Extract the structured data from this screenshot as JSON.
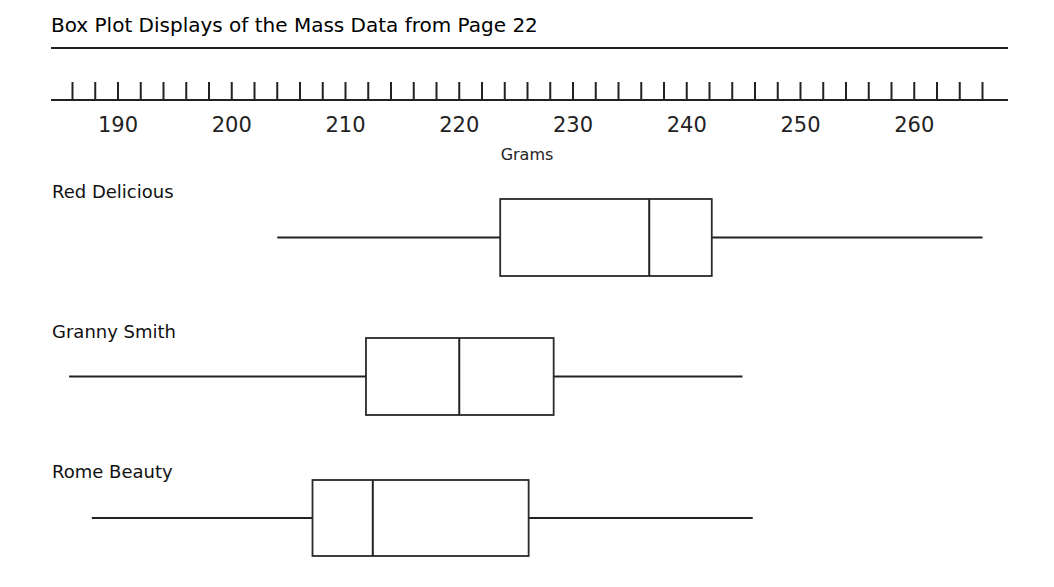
{
  "chart_data": {
    "type": "boxplot",
    "title": "Box Plot Displays of the Mass Data from Page 22",
    "xlabel": "Grams",
    "ylabel": "",
    "xlim": [
      186,
      266
    ],
    "tick_step": 2,
    "tick_labels": [
      190,
      200,
      210,
      220,
      230,
      240,
      250,
      260
    ],
    "grid": false,
    "legend": null,
    "series": [
      {
        "name": "Red Delicious",
        "min": 204,
        "q1": 223.6,
        "median": 236.7,
        "q3": 242.2,
        "max": 266
      },
      {
        "name": "Granny Smith",
        "min": 185.7,
        "q1": 211.8,
        "median": 220,
        "q3": 228.3,
        "max": 244.9
      },
      {
        "name": "Rome Beauty",
        "min": 187.7,
        "q1": 207.1,
        "median": 212.4,
        "q3": 226.1,
        "max": 245.8
      }
    ]
  },
  "layout": {
    "x0_value": 190,
    "x0_px": 118,
    "px_per_unit": 11.375,
    "axis_y": 100,
    "tick_height": 18,
    "axis_left": 51,
    "axis_right": 1008,
    "title_rule_y": 48,
    "rows": [
      {
        "label_y": 198,
        "box_top": 199,
        "box_bottom": 276
      },
      {
        "label_y": 338,
        "box_top": 338,
        "box_bottom": 415
      },
      {
        "label_y": 478,
        "box_top": 480,
        "box_bottom": 556
      }
    ]
  },
  "colors": {
    "ink": "#222222",
    "background": "#ffffff"
  }
}
